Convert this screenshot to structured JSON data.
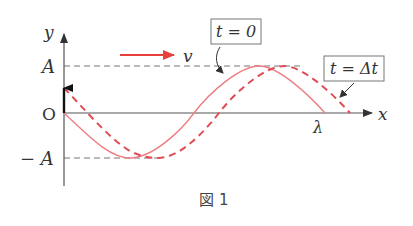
{
  "figure": {
    "caption": "図 1",
    "axes": {
      "y_label": "y",
      "x_label": "x",
      "origin_label": "O",
      "pos_amp_label": "A",
      "neg_amp_label": "− A",
      "wavelength_label": "λ"
    },
    "velocity": {
      "label": "v",
      "color": "#e8403c"
    },
    "curves": [
      {
        "name": "t = 0",
        "label": "t = 0",
        "style": "solid",
        "color": "#ee7b80"
      },
      {
        "name": "t = Δt",
        "label": "t = Δt",
        "style": "dashed",
        "color": "#e14b55"
      }
    ],
    "colors": {
      "axis": "#555555",
      "guide": "#777777",
      "displacement_arrow": "#111111"
    }
  }
}
